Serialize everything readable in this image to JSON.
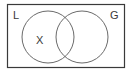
{
  "diagram": {
    "type": "venn",
    "universe": {
      "x": 7,
      "y": 4,
      "width": 118,
      "height": 64,
      "stroke": "#3a3a3a"
    },
    "sets": [
      {
        "label": "L",
        "cx": 48,
        "cy": 37,
        "r": 26,
        "label_x": 13,
        "label_y": 19
      },
      {
        "label": "G",
        "cx": 82,
        "cy": 37,
        "r": 26,
        "label_x": 110,
        "label_y": 19
      }
    ],
    "elements": [
      {
        "label": "X",
        "region": "L only",
        "x": 36,
        "y": 44
      }
    ],
    "stroke_color": "#6a6a6a",
    "text_color": "#3a3a3a"
  }
}
